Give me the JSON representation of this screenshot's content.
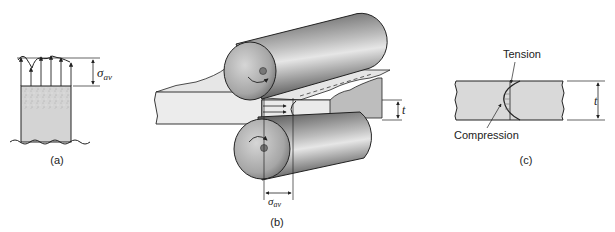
{
  "figure": {
    "panel_a": {
      "caption": "(a)",
      "stress_symbol": "σ",
      "stress_subscript": "av"
    },
    "panel_b": {
      "caption": "(b)",
      "stress_symbol": "σ",
      "stress_subscript": "av",
      "thickness_symbol": "t"
    },
    "panel_c": {
      "caption": "(c)",
      "tension_label": "Tension",
      "compression_label": "Compression",
      "thickness_symbol": "t"
    }
  },
  "colors": {
    "stroke": "#222222",
    "sheet_fill": "#d9d9d9",
    "sheet_top": "#e8e8e8",
    "roll_dark": "#5a5a5a",
    "roll_light": "#d8d8d8"
  }
}
